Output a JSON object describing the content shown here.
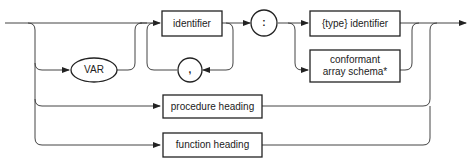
{
  "diagram": {
    "type": "syntax-diagram",
    "nodes": {
      "var": {
        "label": "VAR",
        "shape": "oval"
      },
      "identifier": {
        "label": "identifier",
        "shape": "box"
      },
      "comma": {
        "label": ",",
        "shape": "circle"
      },
      "colon": {
        "label": ":",
        "shape": "circle"
      },
      "type_identifier": {
        "label": "{type} identifier",
        "shape": "box"
      },
      "conformant": {
        "label_line1": "conformant",
        "label_line2": "array schema*",
        "shape": "box"
      },
      "procedure_heading": {
        "label": "procedure heading",
        "shape": "box"
      },
      "function_heading": {
        "label": "function heading",
        "shape": "box"
      }
    },
    "colors": {
      "line": "#333333",
      "background": "#ffffff",
      "text": "#222222"
    }
  }
}
